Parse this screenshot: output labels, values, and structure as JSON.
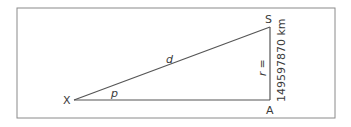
{
  "diagram": {
    "vertices": {
      "X": "X",
      "S": "S",
      "A": "A"
    },
    "labels": {
      "hypotenuse": "d",
      "angle": "p",
      "side_r": "r =",
      "side_r_value": "149597870 km"
    },
    "colors": {
      "line": "#555555",
      "frame": "#777777",
      "text": "#3a3a3a"
    }
  }
}
